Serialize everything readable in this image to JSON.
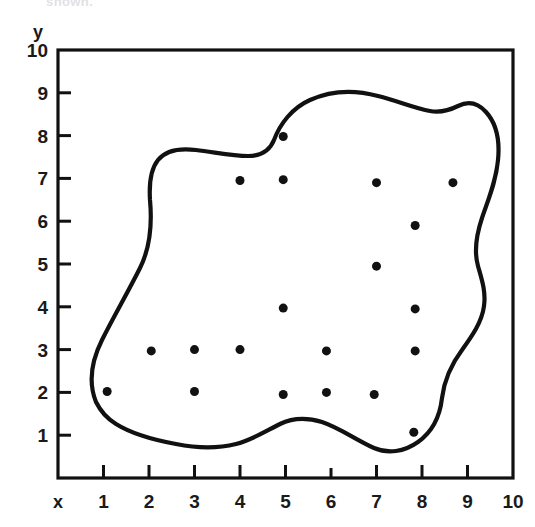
{
  "figure": {
    "kind": "scatter-plot-with-enclosing-curve",
    "clipped_caption": "shown.",
    "background_color": "#ffffff",
    "ink_color": "#111111"
  },
  "axes": {
    "x_axis_name": "x",
    "y_axis_name": "y",
    "x_tick_labels": [
      "1",
      "2",
      "3",
      "4",
      "5",
      "6",
      "7",
      "8",
      "9",
      "10"
    ],
    "y_tick_labels": [
      "1",
      "2",
      "3",
      "4",
      "5",
      "6",
      "7",
      "8",
      "9",
      "10"
    ],
    "frame_color": "#111111",
    "frame_width_px": 3
  },
  "chart_data": {
    "type": "scatter",
    "title": "",
    "subtitle": "",
    "xlabel": "x",
    "ylabel": "y",
    "xlim": [
      0,
      10
    ],
    "ylim": [
      0,
      10
    ],
    "xticks": [
      1,
      2,
      3,
      4,
      5,
      6,
      7,
      8,
      9,
      10
    ],
    "yticks": [
      1,
      2,
      3,
      4,
      5,
      6,
      7,
      8,
      9,
      10
    ],
    "grid": false,
    "legend": null,
    "legend_position": "none",
    "marker": "filled-circle",
    "marker_color": "#111111",
    "marker_size_px": 9,
    "point_count": 20,
    "points": [
      {
        "x": 4.95,
        "y": 7.98
      },
      {
        "x": 4.0,
        "y": 6.95
      },
      {
        "x": 4.95,
        "y": 6.97
      },
      {
        "x": 7.0,
        "y": 6.9
      },
      {
        "x": 8.68,
        "y": 6.9
      },
      {
        "x": 7.85,
        "y": 5.9
      },
      {
        "x": 7.0,
        "y": 4.95
      },
      {
        "x": 4.95,
        "y": 3.97
      },
      {
        "x": 7.85,
        "y": 3.95
      },
      {
        "x": 2.05,
        "y": 2.97
      },
      {
        "x": 3.0,
        "y": 3.0
      },
      {
        "x": 4.0,
        "y": 3.0
      },
      {
        "x": 5.9,
        "y": 2.97
      },
      {
        "x": 7.85,
        "y": 2.97
      },
      {
        "x": 1.08,
        "y": 2.02
      },
      {
        "x": 3.0,
        "y": 2.02
      },
      {
        "x": 4.95,
        "y": 1.95
      },
      {
        "x": 5.9,
        "y": 2.0
      },
      {
        "x": 6.95,
        "y": 1.95
      },
      {
        "x": 7.82,
        "y": 1.07
      }
    ],
    "annotations": [
      {
        "name": "enclosing-region-curve",
        "kind": "closed-freeform-curve",
        "stroke_color": "#111111",
        "stroke_width_px": 4,
        "fill": "none",
        "approx_extent_x": [
          0.95,
          8.95
        ],
        "approx_extent_y": [
          0.75,
          8.9
        ],
        "description": "closed irregular blob enclosing all plotted points"
      }
    ]
  }
}
